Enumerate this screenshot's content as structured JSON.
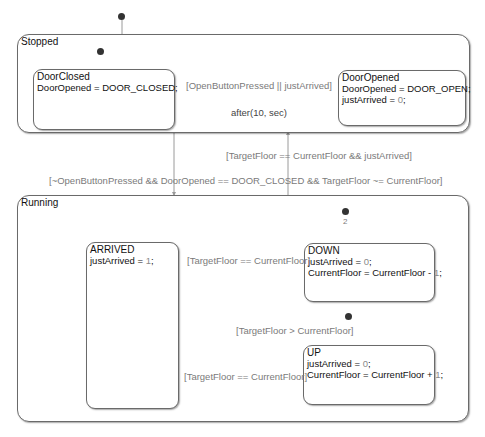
{
  "diagram": {
    "states": {
      "stopped": {
        "name": "Stopped"
      },
      "door_closed": {
        "name": "DoorClosed",
        "actions": [
          "DoorOpened = DOOR_CLOSED;"
        ]
      },
      "door_opened": {
        "name": "DoorOpened",
        "actions": [
          "DoorOpened = DOOR_OPEN;",
          "justArrived = ",
          "0",
          ";"
        ]
      },
      "running": {
        "name": "Running"
      },
      "arrived": {
        "name": "ARRIVED",
        "action_prefix": "justArrived = ",
        "action_value": "1",
        "action_suffix": ";"
      },
      "down": {
        "name": "DOWN",
        "a1_prefix": "justArrived = ",
        "a1_value": "0",
        "a2_prefix": "CurrentFloor = CurrentFloor - ",
        "a2_value": "1",
        "suffix": ";"
      },
      "up": {
        "name": "UP",
        "a1_prefix": "justArrived = ",
        "a1_value": "0",
        "a2_prefix": "CurrentFloor = CurrentFloor + ",
        "a2_value": "1",
        "suffix": ";"
      }
    },
    "transitions": {
      "closed_to_opened": "[OpenButtonPressed || justArrived]",
      "opened_to_closed": "after(10, sec)",
      "running_to_stopped": "[TargetFloor == CurrentFloor && justArrived]",
      "stopped_to_running": "[~OpenButtonPressed && DoorOpened == DOOR_CLOSED && TargetFloor ~= CurrentFloor]",
      "down_to_arrived": "[TargetFloor == CurrentFloor]",
      "up_default": "[TargetFloor > CurrentFloor]",
      "up_to_arrived": "[TargetFloor == CurrentFloor]",
      "down_default_order": "2"
    }
  }
}
